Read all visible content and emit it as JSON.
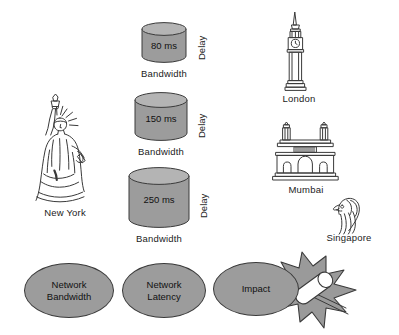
{
  "diagram": {
    "colors": {
      "fill_gray": "#9c9c9c",
      "outline": "#3a3a3a",
      "text": "#111111",
      "background": "#ffffff",
      "burst_fill": "#9a9a9a",
      "rod_fill": "#ffffff"
    },
    "cylinders": [
      {
        "value": "80 ms",
        "delay_label": "Delay",
        "bandwidth_label": "Bandwidth"
      },
      {
        "value": "150 ms",
        "delay_label": "Delay",
        "bandwidth_label": "Bandwidth"
      },
      {
        "value": "250 ms",
        "delay_label": "Delay",
        "bandwidth_label": "Bandwidth"
      }
    ],
    "landmarks": [
      {
        "icon": "statue-of-liberty-icon",
        "label": "New York"
      },
      {
        "icon": "big-ben-icon",
        "label": "London"
      },
      {
        "icon": "gateway-of-india-icon",
        "label": "Mumbai"
      },
      {
        "icon": "merlion-icon",
        "label": "Singapore"
      }
    ],
    "ovals": [
      {
        "line1": "Network",
        "line2": "Bandwidth"
      },
      {
        "line1": "Network",
        "line2": "Latency"
      },
      {
        "line1": "Impact",
        "line2": ""
      }
    ],
    "burst": {
      "icon": "impact-burst-icon"
    }
  }
}
